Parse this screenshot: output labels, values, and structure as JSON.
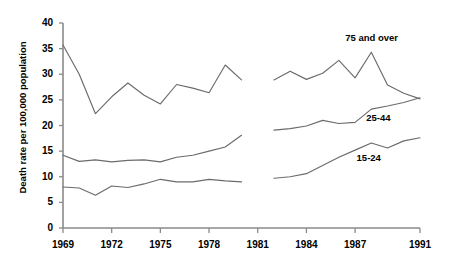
{
  "chart_data": {
    "type": "line",
    "title": "",
    "xlabel": "",
    "ylabel": "Death rate per 100,000 population",
    "xlim": [
      1969,
      1991
    ],
    "ylim": [
      0,
      40
    ],
    "ytick_values": [
      0,
      5,
      10,
      15,
      20,
      25,
      30,
      35,
      40
    ],
    "ytick_labels": [
      "0",
      "5",
      "10",
      "15",
      "20",
      "25",
      "30",
      "35",
      "40"
    ],
    "xtick_values": [
      1969,
      1972,
      1975,
      1978,
      1981,
      1984,
      1987,
      1991
    ],
    "xtick_labels": [
      "1969",
      "1972",
      "1975",
      "1978",
      "1981",
      "1984",
      "1987",
      "1991"
    ],
    "grid": false,
    "legend_position": "inline-annotations",
    "note": "Each series is drawn as two separate segments with a break between 1980 and 1982.",
    "series": [
      {
        "name": "75 and over",
        "label_text": "75 and over",
        "segments": [
          {
            "x": [
              1969,
              1970,
              1971,
              1972,
              1973,
              1974,
              1975,
              1976,
              1977,
              1978,
              1979,
              1980
            ],
            "y": [
              35.7,
              30.0,
              22.3,
              25.6,
              28.3,
              25.9,
              24.2,
              28.0,
              27.3,
              26.4,
              31.8,
              28.9
            ]
          },
          {
            "x": [
              1982,
              1983,
              1984,
              1985,
              1986,
              1987,
              1988,
              1989,
              1990,
              1991
            ],
            "y": [
              28.9,
              30.6,
              29.0,
              30.2,
              32.7,
              29.3,
              34.3,
              27.9,
              26.3,
              25.2
            ]
          }
        ]
      },
      {
        "name": "25-44",
        "label_text": "25-44",
        "segments": [
          {
            "x": [
              1969,
              1970,
              1971,
              1972,
              1973,
              1974,
              1975,
              1976,
              1977,
              1978,
              1979,
              1980
            ],
            "y": [
              14.2,
              13.0,
              13.3,
              12.9,
              13.2,
              13.3,
              12.9,
              13.8,
              14.2,
              15.0,
              15.8,
              18.1
            ]
          },
          {
            "x": [
              1982,
              1983,
              1984,
              1985,
              1986,
              1987,
              1988,
              1989,
              1990,
              1991
            ],
            "y": [
              19.1,
              19.4,
              19.9,
              21.0,
              20.4,
              20.6,
              23.2,
              23.8,
              24.5,
              25.4
            ]
          }
        ]
      },
      {
        "name": "15-24",
        "label_text": "15-24",
        "segments": [
          {
            "x": [
              1969,
              1970,
              1971,
              1972,
              1973,
              1974,
              1975,
              1976,
              1977,
              1978,
              1979,
              1980
            ],
            "y": [
              8.0,
              7.8,
              6.4,
              8.2,
              7.9,
              8.6,
              9.5,
              9.0,
              9.0,
              9.5,
              9.2,
              9.0
            ]
          },
          {
            "x": [
              1982,
              1983,
              1984,
              1985,
              1986,
              1987,
              1988,
              1989,
              1990,
              1991
            ],
            "y": [
              9.7,
              10.0,
              10.6,
              12.2,
              13.8,
              15.2,
              16.6,
              15.6,
              17.0,
              17.6
            ]
          }
        ]
      }
    ],
    "annotations": [
      {
        "text": "75 and over",
        "x": 1987.5,
        "y": 37.0
      },
      {
        "text": "25-44",
        "x": 1988.8,
        "y": 21.5
      },
      {
        "text": "15-24",
        "x": 1988.2,
        "y": 13.6
      }
    ]
  },
  "axis": {
    "y_title": "Death rate per 100,000 population"
  },
  "style": {
    "line_color": "#6b6b6b",
    "axis_color": "#8a8a8a",
    "text_color": "#000000",
    "background": "#ffffff"
  }
}
